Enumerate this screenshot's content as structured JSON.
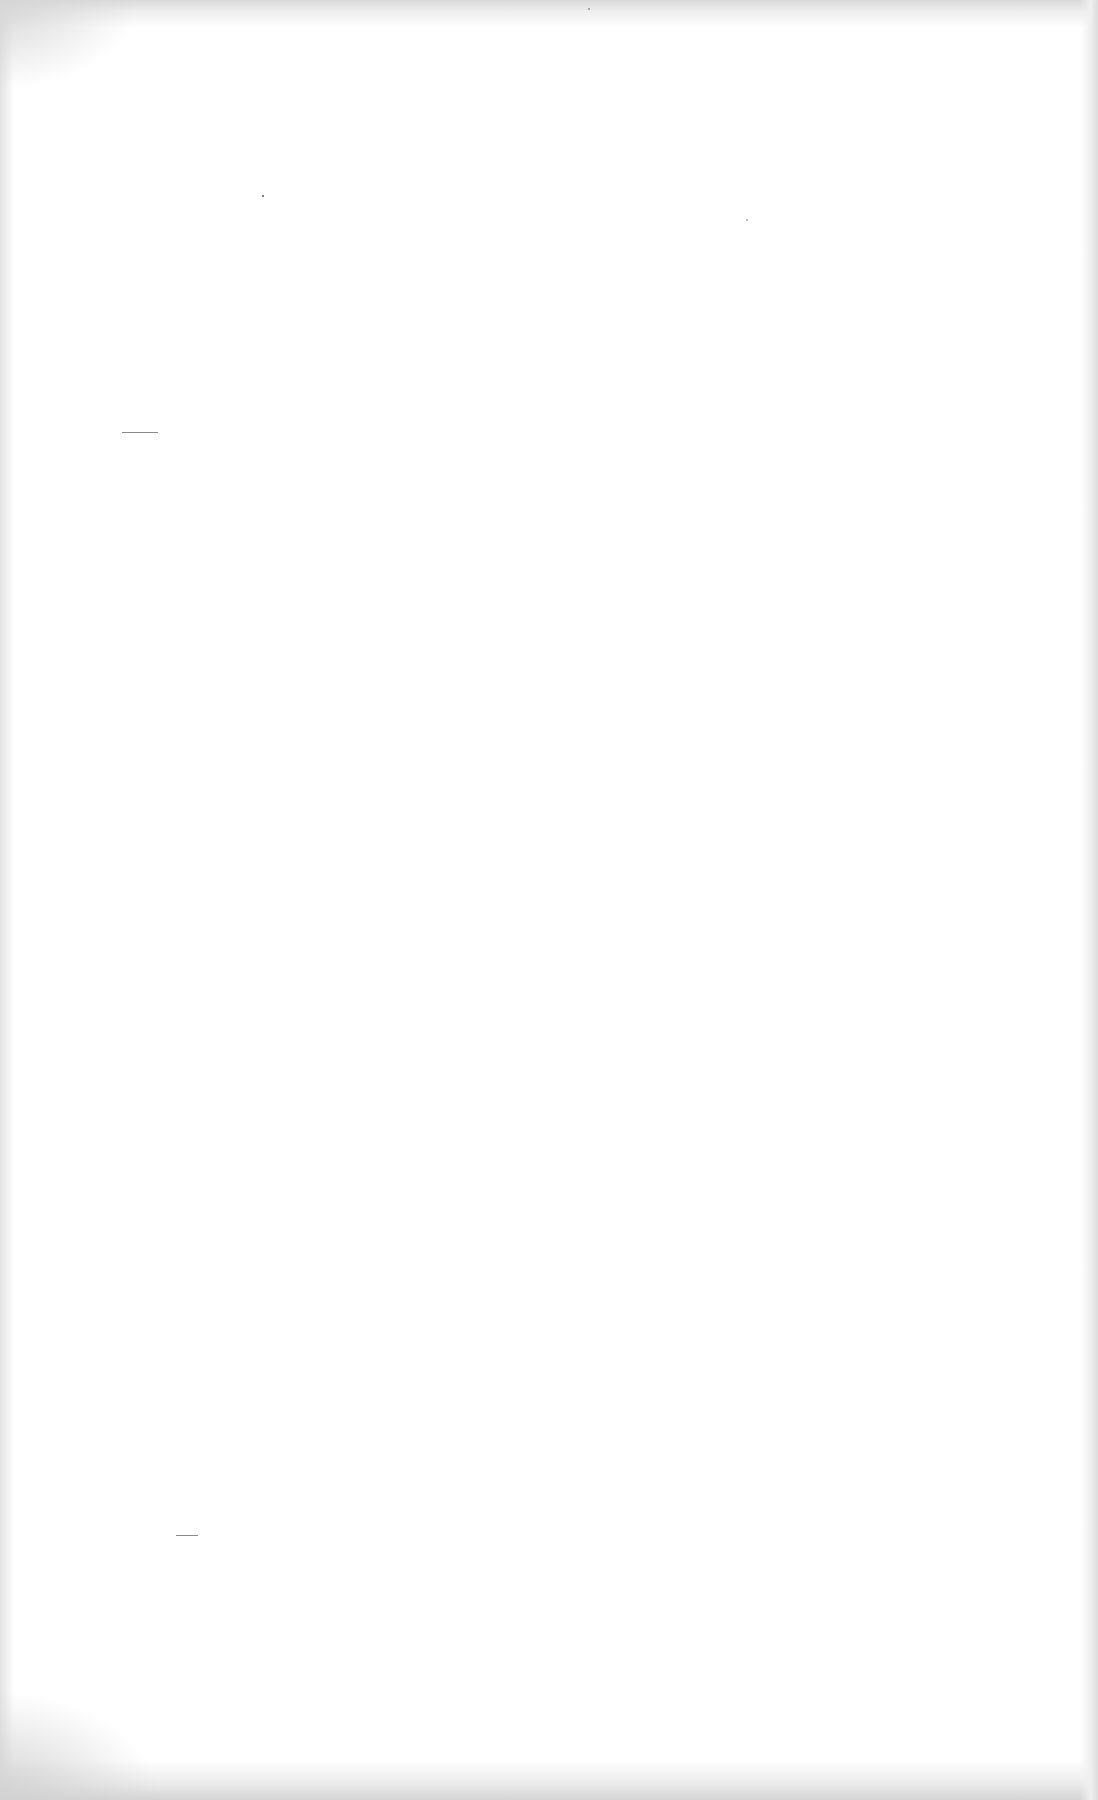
{
  "page": {
    "background": "#ffffff",
    "rules": [
      {
        "id": "rule-1",
        "x": 122,
        "y": 432,
        "width": 36
      },
      {
        "id": "rule-2",
        "x": 176,
        "y": 1535,
        "width": 22
      }
    ],
    "text": []
  }
}
